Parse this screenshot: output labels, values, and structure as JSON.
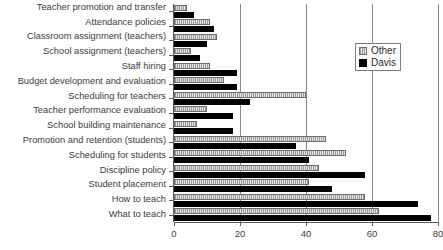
{
  "chart_data": {
    "type": "bar",
    "orientation": "horizontal",
    "title": "",
    "xlabel": "",
    "ylabel": "",
    "xlim": [
      0,
      80
    ],
    "xticks": [
      0,
      20,
      40,
      60,
      80
    ],
    "grid": true,
    "legend_position": "top-right",
    "categories": [
      "Teacher promotion and transfer",
      "Attendance policies",
      "Classroom assignment (teachers)",
      "School assignment (teachers)",
      "Staff hiring",
      "Budget development and evaluation",
      "Scheduling for teachers",
      "Teacher performance evaluation",
      "School building maintenance",
      "Promotion and retention (students)",
      "Scheduling for students",
      "Discipline policy",
      "Student placement",
      "How to teach",
      "What to teach"
    ],
    "series": [
      {
        "name": "Other",
        "color": "#d2d2d2",
        "values": [
          4,
          11,
          13,
          5,
          11,
          15,
          40,
          10,
          7,
          46,
          52,
          44,
          41,
          58,
          62
        ]
      },
      {
        "name": "Davis",
        "color": "#000000",
        "values": [
          6,
          12,
          10,
          8,
          19,
          19,
          23,
          18,
          18,
          37,
          41,
          58,
          48,
          74,
          78
        ]
      }
    ]
  },
  "legend": {
    "items": [
      {
        "label": "Other"
      },
      {
        "label": "Davis"
      }
    ]
  },
  "axis": {
    "tick_labels": [
      "0",
      "20",
      "40",
      "60",
      "80"
    ]
  }
}
